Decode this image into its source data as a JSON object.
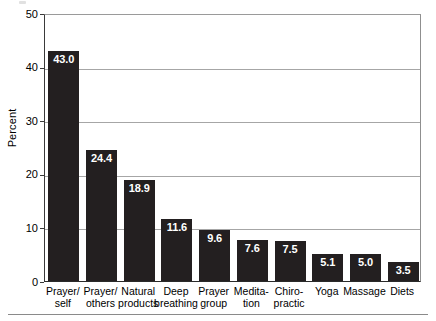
{
  "chart_data": {
    "type": "bar",
    "title": "",
    "xlabel": "",
    "ylabel": "Percent",
    "ylim": [
      0,
      50
    ],
    "yticks": [
      0,
      10,
      20,
      30,
      40,
      50
    ],
    "ytick_labels": [
      "0",
      "10",
      "20",
      "30",
      "40",
      "50"
    ],
    "grid": "horizontal",
    "legend": "none",
    "bar_color": "#231f20",
    "value_label_color": "#ffffff",
    "categories": [
      "Prayer/ self",
      "Prayer/ others",
      "Natural products",
      "Deep breathing",
      "Prayer group",
      "Medita- tion",
      "Chiro- practic",
      "Yoga",
      "Massage",
      "Diets"
    ],
    "category_lines": [
      [
        "Prayer/",
        "self"
      ],
      [
        "Prayer/",
        "others"
      ],
      [
        "Natural",
        "products"
      ],
      [
        "Deep",
        "breathing"
      ],
      [
        "Prayer",
        "group"
      ],
      [
        "Medita-",
        "tion"
      ],
      [
        "Chiro-",
        "practic"
      ],
      [
        "Yoga",
        ""
      ],
      [
        "Massage",
        ""
      ],
      [
        "Diets",
        ""
      ]
    ],
    "values": [
      43.0,
      24.4,
      18.9,
      11.6,
      9.6,
      7.6,
      7.5,
      5.1,
      5.0,
      3.5
    ],
    "value_labels": [
      "43.0",
      "24.4",
      "18.9",
      "11.6",
      "9.6",
      "7.6",
      "7.5",
      "5.1",
      "5.0",
      "3.5"
    ]
  }
}
